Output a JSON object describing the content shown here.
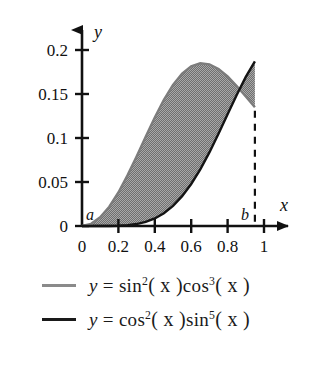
{
  "chart_data": {
    "type": "line",
    "title": "",
    "xlabel": "x",
    "ylabel": "y",
    "xlim": [
      0,
      1.12
    ],
    "ylim": [
      0,
      0.215
    ],
    "xticks": [
      "0",
      "0.2",
      "0.4",
      "0.6",
      "0.8",
      "1"
    ],
    "xtick_values": [
      0,
      0.2,
      0.4,
      0.6,
      0.8,
      1
    ],
    "yticks": [
      "0",
      "0.05",
      "0.1",
      "0.15",
      "0.2"
    ],
    "ytick_values": [
      0,
      0.05,
      0.1,
      0.15,
      0.2
    ],
    "grid": false,
    "legend_position": "below",
    "shaded_region": {
      "label": "area between curves",
      "from": "a",
      "to": "b",
      "fill": "#8c8c8c"
    },
    "annotations": [
      {
        "name": "a",
        "text": "a",
        "x": 0.0,
        "y": 0.0
      },
      {
        "name": "b",
        "text": "b",
        "x": 0.95,
        "y": 0.0
      }
    ],
    "intersection": {
      "x": 0.95,
      "y": 0.131
    },
    "series": [
      {
        "name": "y = sin^2(x)cos^3(x)",
        "color": "#8a8a8a",
        "x": [
          0,
          0.05,
          0.1,
          0.15,
          0.2,
          0.25,
          0.3,
          0.35,
          0.4,
          0.45,
          0.5,
          0.55,
          0.6,
          0.65,
          0.7,
          0.75,
          0.8,
          0.85,
          0.9,
          0.95,
          1.0
        ],
        "values": [
          0,
          0.00249,
          0.00989,
          0.02195,
          0.03811,
          0.05752,
          0.07909,
          0.1015,
          0.12339,
          0.14341,
          0.16035,
          0.17326,
          0.18153,
          0.18496,
          0.18375,
          0.17845,
          0.16989,
          0.15908,
          0.1471,
          0.13503,
          0.1238
        ]
      },
      {
        "name": "y = cos^2(x)sin^5(x)",
        "color": "#1a1a1a",
        "x": [
          0,
          0.05,
          0.1,
          0.15,
          0.2,
          0.25,
          0.3,
          0.35,
          0.4,
          0.45,
          0.5,
          0.55,
          0.6,
          0.65,
          0.7,
          0.75,
          0.8,
          0.85,
          0.9,
          0.95,
          1.0
        ],
        "values": [
          0,
          3e-07,
          9.9e-06,
          7.46e-05,
          0.00031,
          0.00092,
          0.00222,
          0.00463,
          0.00858,
          0.01452,
          0.02285,
          0.03387,
          0.04775,
          0.06444,
          0.08363,
          0.10473,
          0.12686,
          0.14887,
          0.16942,
          0.18704,
          0.20027
        ]
      }
    ]
  },
  "legend": {
    "entries": [
      {
        "swatch": "upper",
        "prefix": "y",
        "eq": "=",
        "fn1": "sin",
        "exp1": "2",
        "arg1": "( x )",
        "fn2": "cos",
        "exp2": "3",
        "arg2": "( x )"
      },
      {
        "swatch": "lower",
        "prefix": "y",
        "eq": "=",
        "fn1": "cos",
        "exp1": "2",
        "arg1": "( x )",
        "fn2": "sin",
        "exp2": "5",
        "arg2": "( x )"
      }
    ]
  },
  "axes": {
    "x_name": "x",
    "y_name": "y"
  }
}
